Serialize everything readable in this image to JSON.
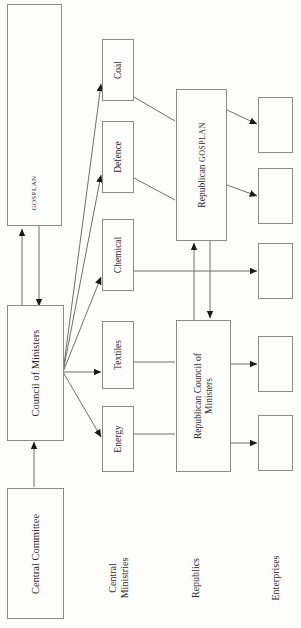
{
  "diagram": {
    "orientation": "rotated-90-ccw",
    "background_color": "#fdfdfb",
    "line_color": "#6f6f6d",
    "box_border_color": "#8a8a88",
    "text_color": "#2b2b2b"
  },
  "nodes": {
    "gosplan": {
      "label": "GOSPLAN",
      "style": "small-caps"
    },
    "council_of_ministers": {
      "label": "Council of Ministers"
    },
    "central_committee": {
      "label": "Central  Committee"
    },
    "republican_gosplan": {
      "label_main": "Republican",
      "label_sc": "GOSPLAN"
    },
    "republican_council": {
      "line1": "Republican Council of",
      "line2": "Ministers"
    }
  },
  "ministries": [
    {
      "label": "Coal"
    },
    {
      "label": "Defence"
    },
    {
      "label": "Chemical"
    },
    {
      "label": "Textiles"
    },
    {
      "label": "Energy"
    }
  ],
  "enterprises": [
    {
      "label": ""
    },
    {
      "label": ""
    },
    {
      "label": ""
    },
    {
      "label": ""
    },
    {
      "label": ""
    }
  ],
  "column_captions": [
    {
      "line1": "Central",
      "line2": "Ministries"
    },
    {
      "line1": "Republics",
      "line2": ""
    },
    {
      "line1": "Enterprises",
      "line2": ""
    }
  ],
  "edges": [
    {
      "from": "gosplan",
      "to": "council_of_ministers",
      "type": "bidirectional"
    },
    {
      "from": "central_committee",
      "to": "council_of_ministers",
      "type": "arrow"
    },
    {
      "from": "council_of_ministers",
      "to": "coal",
      "type": "arrow"
    },
    {
      "from": "council_of_ministers",
      "to": "defence",
      "type": "arrow"
    },
    {
      "from": "council_of_ministers",
      "to": "chemical",
      "type": "arrow"
    },
    {
      "from": "council_of_ministers",
      "to": "textiles",
      "type": "arrow"
    },
    {
      "from": "council_of_ministers",
      "to": "energy",
      "type": "arrow"
    },
    {
      "from": "coal",
      "to": "republican_gosplan",
      "type": "plain"
    },
    {
      "from": "defence",
      "to": "republican_gosplan",
      "type": "plain"
    },
    {
      "from": "chemical",
      "to": "enterprise_3",
      "type": "arrow"
    },
    {
      "from": "textiles",
      "to": "republican_council",
      "type": "plain"
    },
    {
      "from": "energy",
      "to": "republican_council",
      "type": "plain"
    },
    {
      "from": "republican_gosplan",
      "to": "republican_council",
      "type": "bidirectional"
    },
    {
      "from": "republican_gosplan",
      "to": "enterprise_1",
      "type": "arrow"
    },
    {
      "from": "republican_gosplan",
      "to": "enterprise_2",
      "type": "arrow"
    },
    {
      "from": "republican_council",
      "to": "enterprise_4",
      "type": "arrow"
    },
    {
      "from": "republican_council",
      "to": "enterprise_5",
      "type": "arrow"
    }
  ]
}
